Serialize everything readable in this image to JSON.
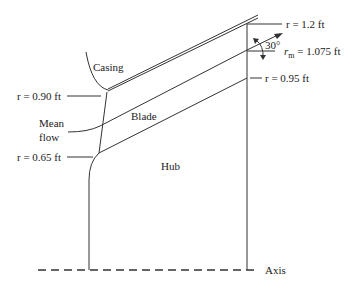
{
  "diagram": {
    "labels": {
      "casing": "Casing",
      "blade": "Blade",
      "hub": "Hub",
      "mean_flow_1": "Mean",
      "mean_flow_2": "flow",
      "axis": "Axis",
      "angle": "30°",
      "r_tip": "r = 1.2 ft",
      "r_mean_prefix": "r",
      "r_mean_sub": "m",
      "r_mean_value": " = 1.075 ft",
      "r_hub_exit": "r = 0.95 ft",
      "r_inlet_tip": "r = 0.90 ft",
      "r_inlet_hub": "r = 0.65 ft"
    }
  }
}
